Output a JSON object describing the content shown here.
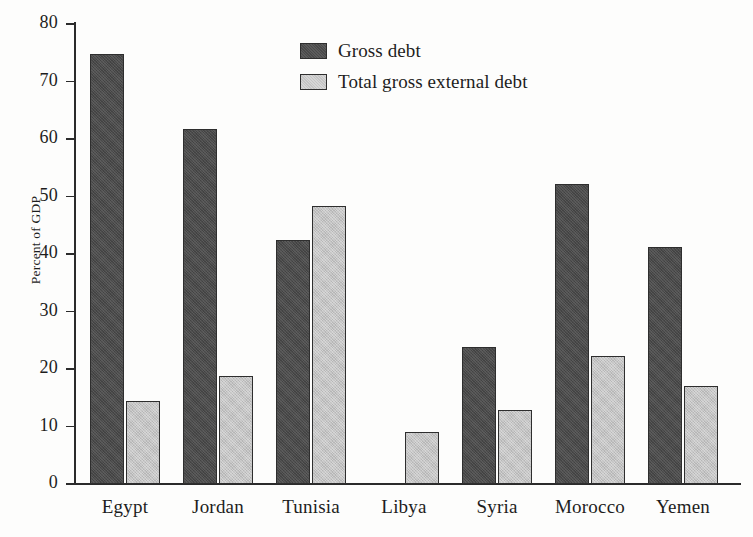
{
  "chart_data": {
    "type": "bar",
    "title": "",
    "xlabel": "",
    "ylabel": "Percent of GDP",
    "ylim": [
      0,
      80
    ],
    "ytick_step": 10,
    "yticks": [
      "80",
      "70",
      "60",
      "50",
      "40",
      "30",
      "20",
      "10",
      "0"
    ],
    "grid": false,
    "legend_position": "top-center",
    "categories": [
      "Egypt",
      "Jordan",
      "Tunisia",
      "Libya",
      "Syria",
      "Morocco",
      "Yemen"
    ],
    "series": [
      {
        "name": "Gross debt",
        "color": "#4a4a4a",
        "values": [
          74.8,
          61.8,
          42.5,
          null,
          23.8,
          52.1,
          41.2
        ]
      },
      {
        "name": "Total gross external debt",
        "color": "#c4c4c4",
        "values": [
          14.5,
          18.7,
          48.4,
          9.0,
          12.8,
          22.2,
          17.0
        ]
      }
    ]
  },
  "axis": {
    "y_title": "Percent of GDP"
  },
  "legend": {
    "items": [
      {
        "label": "Gross debt",
        "swatch": "dark"
      },
      {
        "label": "Total gross external debt",
        "swatch": "light"
      }
    ]
  }
}
